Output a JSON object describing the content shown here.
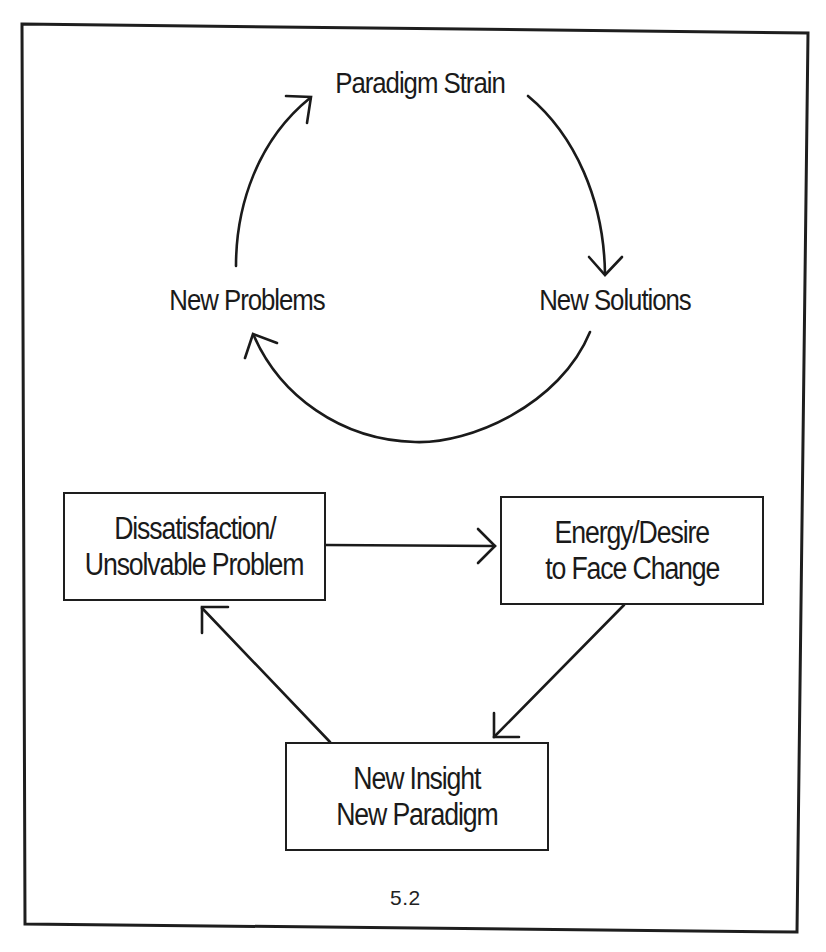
{
  "figure": {
    "number": "5.2",
    "frame_color": "#1e1e1e",
    "stroke_color": "#1a1a1a",
    "cycle": {
      "nodes": [
        {
          "id": "paradigm-strain",
          "label": "Paradigm Strain"
        },
        {
          "id": "new-solutions",
          "label": "New Solutions"
        },
        {
          "id": "new-problems",
          "label": "New Problems"
        }
      ],
      "edges": [
        {
          "from": "new-problems",
          "to": "paradigm-strain"
        },
        {
          "from": "paradigm-strain",
          "to": "new-solutions"
        },
        {
          "from": "new-solutions",
          "to": "new-problems"
        }
      ]
    },
    "process": {
      "boxes": [
        {
          "id": "dissatisfaction",
          "lines": [
            "Dissatisfaction/",
            "Unsolvable Problem"
          ]
        },
        {
          "id": "energy-desire",
          "lines": [
            "Energy/Desire",
            "to Face Change"
          ]
        },
        {
          "id": "new-insight",
          "lines": [
            "New Insight",
            "New Paradigm"
          ]
        }
      ],
      "edges": [
        {
          "from": "dissatisfaction",
          "to": "energy-desire"
        },
        {
          "from": "energy-desire",
          "to": "new-insight"
        },
        {
          "from": "new-insight",
          "to": "dissatisfaction"
        }
      ]
    }
  }
}
